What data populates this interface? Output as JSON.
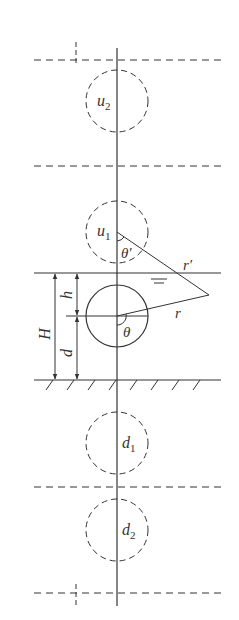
{
  "diagram": {
    "labels": {
      "u2": {
        "base": "u",
        "sub": "2"
      },
      "u1": {
        "base": "u",
        "sub": "1"
      },
      "d1": {
        "base": "d",
        "sub": "1"
      },
      "d2": {
        "base": "d",
        "sub": "2"
      },
      "theta_prime": "θ′",
      "theta": "θ",
      "r_prime": "r′",
      "r": "r",
      "H": "H",
      "h": "h",
      "d": "d",
      "water_level_symbol": "═"
    },
    "elements": {
      "images_above": [
        "u2",
        "u1"
      ],
      "real_cylinder": "main",
      "images_below": [
        "d1",
        "d2"
      ],
      "free_surface": "solid line",
      "seabed": "hatched solid line",
      "period_boundaries": "dashed lines"
    },
    "colors": {
      "stroke": "#333333",
      "background": "#ffffff"
    }
  }
}
